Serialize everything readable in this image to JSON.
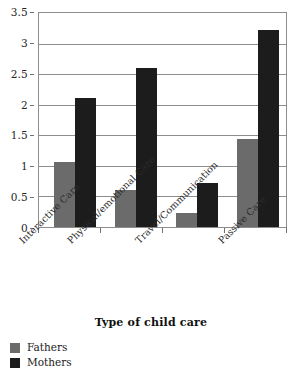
{
  "chart_data": {
    "type": "bar",
    "title": "",
    "xlabel": "Type of child care",
    "ylabel": "",
    "categories": [
      "Interactive Care",
      "Physical/emotional Care",
      "Travel/Communication",
      "Passive Care"
    ],
    "series": [
      {
        "name": "Fathers",
        "color": "#6b6b6b",
        "values": [
          1.07,
          0.6,
          0.23,
          1.44
        ]
      },
      {
        "name": "Mothers",
        "color": "#1c1c1c",
        "values": [
          2.11,
          2.6,
          0.72,
          3.22
        ]
      }
    ],
    "ylim": [
      0,
      3.5
    ],
    "ytick_labels": [
      "0",
      "0.5",
      "1",
      "1.5",
      "2",
      "2.5",
      "3",
      "3.5"
    ],
    "ytick_values": [
      0,
      0.5,
      1,
      1.5,
      2,
      2.5,
      3,
      3.5
    ],
    "grid": true,
    "grid_axis": "y",
    "legend_position": "bottom-left",
    "xtick_label_rotation": -45
  },
  "legend": {
    "entries": [
      {
        "label": "Fathers",
        "color": "#6b6b6b"
      },
      {
        "label": "Mothers",
        "color": "#1c1c1c"
      }
    ]
  }
}
